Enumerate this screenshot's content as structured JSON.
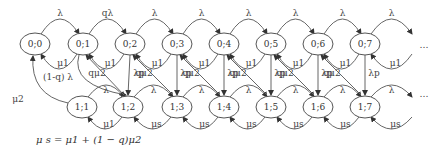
{
  "diagram": {
    "type": "markov-chain-state-diagram",
    "top_row": {
      "nodes": [
        "0;0",
        "0;1",
        "0;2",
        "0;3",
        "0;4",
        "0;5",
        "0;6",
        "0;7"
      ],
      "forward_labels": [
        "λ",
        "qλ",
        "λ",
        "λ",
        "λ",
        "λ",
        "λ",
        "λ"
      ],
      "backward_labels": [
        "μ1",
        "μ1",
        "μ1",
        "μ1",
        "μ1",
        "μ1",
        "μ1",
        "μ1"
      ],
      "ellipsis": "…"
    },
    "bottom_row": {
      "nodes": [
        "1;1",
        "1;2",
        "1;3",
        "1;4",
        "1;5",
        "1;6",
        "1;7"
      ],
      "forward_labels": [
        "λ",
        "λ",
        "λ",
        "λ",
        "λ",
        "λ",
        "λ"
      ],
      "backward_labels": [
        "μ1",
        "μs",
        "μs",
        "μs",
        "μs",
        "μs",
        "μs"
      ],
      "ellipsis": "…"
    },
    "cross_labels": {
      "down_from_0_1": "(1-q) λ",
      "up_to_0_0": "μ2",
      "diagonal_up": [
        "qμ2",
        "qμ2",
        "qμ2",
        "qμ2",
        "qμ2",
        "qμ2"
      ],
      "vertical_down": [
        "λp",
        "λp",
        "λp",
        "λp",
        "λp",
        "λp"
      ]
    },
    "formula": "μ s = μ1 + (1 − q)μ2"
  }
}
